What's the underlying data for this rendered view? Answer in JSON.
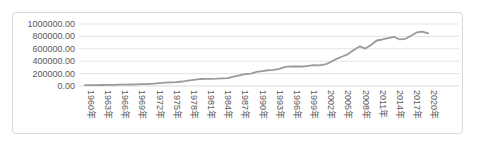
{
  "chart_data": {
    "type": "line",
    "title": "",
    "xlabel": "",
    "ylabel": "",
    "legend": "none",
    "grid": "horizontal",
    "ylim": [
      0,
      1000000
    ],
    "y_step": 200000,
    "x_label_interval": 3,
    "y_tick_labels": [
      "1000000.00",
      "800000.00",
      "600000.00",
      "400000.00",
      "200000.00",
      "0.00"
    ],
    "x_tick_labels": [
      "1960年",
      "1963年",
      "1966年",
      "1969年",
      "1972年",
      "1975年",
      "1978年",
      "1981年",
      "1984年",
      "1987年",
      "1990年",
      "1993年",
      "1996年",
      "1999年",
      "2002年",
      "2005年",
      "2008年",
      "2011年",
      "2014年",
      "2017年",
      "2020年"
    ],
    "x": [
      1960,
      1961,
      1962,
      1963,
      1964,
      1965,
      1966,
      1967,
      1968,
      1969,
      1970,
      1971,
      1972,
      1973,
      1974,
      1975,
      1976,
      1977,
      1978,
      1979,
      1980,
      1981,
      1982,
      1983,
      1984,
      1985,
      1986,
      1987,
      1988,
      1989,
      1990,
      1991,
      1992,
      1993,
      1994,
      1995,
      1996,
      1997,
      1998,
      1999,
      2000,
      2001,
      2002,
      2003,
      2004,
      2005,
      2006,
      2007,
      2008,
      2009,
      2010,
      2011,
      2012,
      2013,
      2014,
      2015,
      2016,
      2017,
      2018,
      2019,
      2020
    ],
    "values": [
      13660,
      14210,
      15190,
      16390,
      17950,
      19560,
      21270,
      22680,
      24570,
      27070,
      29650,
      32640,
      37690,
      45920,
      52850,
      58960,
      64060,
      72280,
      85320,
      99510,
      112540,
      115910,
      114970,
      117340,
      121880,
      127950,
      150730,
      171450,
      191990,
      200730,
      227630,
      239340,
      254240,
      258570,
      277800,
      308700,
      315640,
      314450,
      314120,
      325540,
      336270,
      334140,
      347450,
      389930,
      438850,
      475250,
      514760,
      580810,
      637680,
      603410,
      661480,
      733760,
      750110,
      771980,
      793930,
      750450,
      761700,
      811400,
      864200,
      876600,
      849100
    ],
    "style": {
      "line_color": "#9a9a9a",
      "gridline_color": "#e4e4e4",
      "axis_line_color": "#d9d9d9",
      "tick_text_color": "#595959",
      "card_border_color": "#d9d9d9",
      "background": "#ffffff"
    }
  }
}
